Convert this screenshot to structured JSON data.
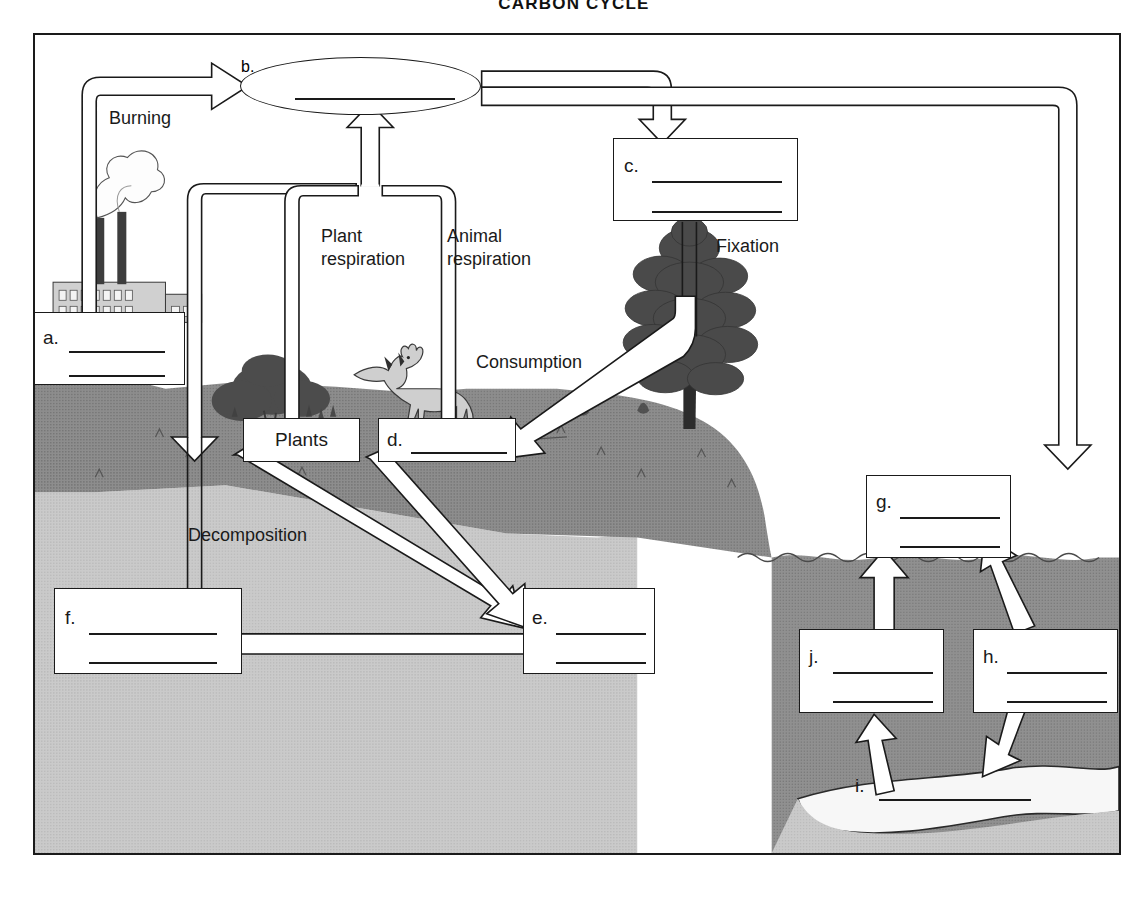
{
  "title": "CARBON CYCLE",
  "diagram": {
    "type": "carbon-cycle-worksheet",
    "process_labels": [
      {
        "id": "burning",
        "text": "Burning"
      },
      {
        "id": "plant-respiration",
        "text": "Plant\nrespiration"
      },
      {
        "id": "animal-respiration",
        "text": "Animal\nrespiration"
      },
      {
        "id": "fixation",
        "text": "Fixation"
      },
      {
        "id": "consumption",
        "text": "Consumption"
      },
      {
        "id": "decomposition",
        "text": "Decomposition"
      }
    ],
    "filled_boxes": [
      {
        "id": "plants",
        "text": "Plants"
      }
    ],
    "blank_boxes": [
      {
        "id": "a",
        "tag": "a.",
        "lines": 2
      },
      {
        "id": "b",
        "tag": "b.",
        "lines": 1
      },
      {
        "id": "c",
        "tag": "c.",
        "lines": 2
      },
      {
        "id": "d",
        "tag": "d.",
        "lines": 1
      },
      {
        "id": "e",
        "tag": "e.",
        "lines": 2
      },
      {
        "id": "f",
        "tag": "f.",
        "lines": 2
      },
      {
        "id": "g",
        "tag": "g.",
        "lines": 2
      },
      {
        "id": "h",
        "tag": "h.",
        "lines": 2
      },
      {
        "id": "i",
        "tag": "i.",
        "lines": 1
      },
      {
        "id": "j",
        "tag": "j.",
        "lines": 2
      }
    ],
    "colors": {
      "ink": "#1a1a1a",
      "paper": "#ffffff",
      "soil_dark": "#8b8b8b",
      "soil_light": "#c9c9c9",
      "water": "#8b8b8b",
      "sediment": "#f4f4f4"
    }
  },
  "boxes": {
    "a": {
      "tag": "a."
    },
    "b": {
      "tag": "b."
    },
    "c": {
      "tag": "c."
    },
    "d": {
      "tag": "d."
    },
    "e": {
      "tag": "e."
    },
    "f": {
      "tag": "f."
    },
    "g": {
      "tag": "g."
    },
    "h": {
      "tag": "h."
    },
    "i": {
      "tag": "i."
    },
    "j": {
      "tag": "j."
    },
    "plants": {
      "text": "Plants"
    }
  },
  "labels": {
    "burning": "Burning",
    "plant_respiration": "Plant\nrespiration",
    "animal_respiration": "Animal\nrespiration",
    "fixation": "Fixation",
    "consumption": "Consumption",
    "decomposition": "Decomposition"
  }
}
